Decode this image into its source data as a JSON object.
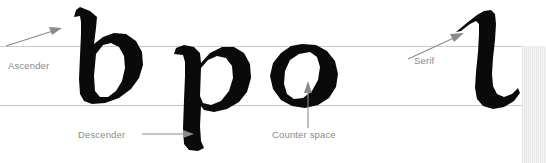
{
  "diagram": {
    "background_color": "#ffffff",
    "glyph_color": "#0a0a0a",
    "guideline_color": "#c9c9c9",
    "label_color": "#8a8a8a",
    "edge_strip_color": "#e8e8e8",
    "width": 546,
    "height": 163
  },
  "guidelines": [
    {
      "name": "x-height-line",
      "y": 46
    },
    {
      "name": "baseline",
      "y": 105
    }
  ],
  "glyphs": [
    {
      "name": "b",
      "character": "b"
    },
    {
      "name": "p",
      "character": "p"
    },
    {
      "name": "o",
      "character": "o"
    },
    {
      "name": "l",
      "character": "l"
    }
  ],
  "annotations": {
    "ascender": {
      "label": "Ascender",
      "target_glyph": "b",
      "arrow_direction": "up-right"
    },
    "descender": {
      "label": "Descender",
      "target_glyph": "p",
      "arrow_direction": "right"
    },
    "counter_space": {
      "label": "Counter space",
      "target_glyph": "o",
      "arrow_direction": "up"
    },
    "serif": {
      "label": "Serif",
      "target_glyph": "l",
      "arrow_direction": "up-right"
    }
  }
}
